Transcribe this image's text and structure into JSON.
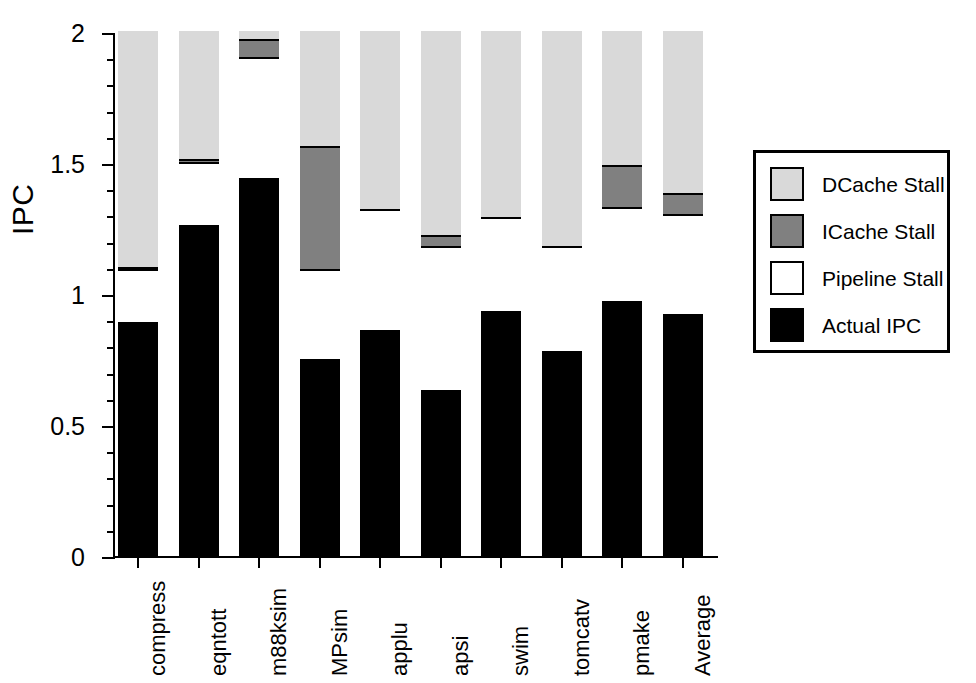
{
  "chart_data": {
    "type": "bar",
    "title": "",
    "subtitle": "",
    "xlabel": "",
    "ylabel": "IPC",
    "ylim": [
      0,
      2
    ],
    "ytick_labels": [
      "0",
      "0.5",
      "1",
      "1.5",
      "2"
    ],
    "ytick_values": [
      0,
      0.5,
      1,
      1.5,
      2
    ],
    "yminor_step": 0.1,
    "grid": false,
    "stacked": true,
    "legend_position": "right",
    "categories": [
      "compress",
      "eqntott",
      "m88ksim",
      "MPsim",
      "applu",
      "apsi",
      "swim",
      "tomcatv",
      "pmake",
      "Average"
    ],
    "series": [
      {
        "name": "Actual IPC",
        "color": "#000000",
        "values": [
          0.89,
          1.26,
          1.44,
          0.75,
          0.86,
          0.63,
          0.93,
          0.78,
          0.97,
          0.92
        ]
      },
      {
        "name": "Pipeline Stall",
        "color": "#ffffff",
        "values": [
          0.2,
          0.24,
          0.46,
          0.34,
          0.46,
          0.55,
          0.36,
          0.4,
          0.36,
          0.38
        ]
      },
      {
        "name": "ICache Stall",
        "color": "#808080",
        "values": [
          0.01,
          0.01,
          0.07,
          0.47,
          0.0,
          0.04,
          0.0,
          0.0,
          0.16,
          0.08
        ]
      },
      {
        "name": "DCache Stall",
        "color": "#d9d9d9",
        "values": [
          0.9,
          0.49,
          0.03,
          0.44,
          0.68,
          0.78,
          0.71,
          0.82,
          0.51,
          0.62
        ]
      }
    ],
    "cumulative_tops": {
      "actual_ipc": [
        0.89,
        1.26,
        1.44,
        0.75,
        0.86,
        0.63,
        0.93,
        0.78,
        0.97,
        0.92
      ],
      "pipeline_stall": [
        1.09,
        1.5,
        1.9,
        1.09,
        1.32,
        1.18,
        1.29,
        1.18,
        1.33,
        1.3
      ],
      "icache_stall": [
        1.1,
        1.51,
        1.97,
        1.56,
        1.32,
        1.22,
        1.29,
        1.18,
        1.49,
        1.38
      ],
      "dcache_stall": [
        2.0,
        2.0,
        2.0,
        2.0,
        2.0,
        2.0,
        2.0,
        2.0,
        2.0,
        2.0
      ]
    }
  },
  "legend": {
    "entries": [
      {
        "label": "DCache Stall",
        "swatch": "#d9d9d9"
      },
      {
        "label": "ICache Stall",
        "swatch": "#808080"
      },
      {
        "label": "Pipeline Stall",
        "swatch": "#ffffff"
      },
      {
        "label": "Actual IPC",
        "swatch": "#000000"
      }
    ]
  },
  "axis": {
    "y_title": "IPC",
    "y_labels": [
      "2",
      "1.5",
      "1",
      "0.5",
      "0"
    ]
  }
}
